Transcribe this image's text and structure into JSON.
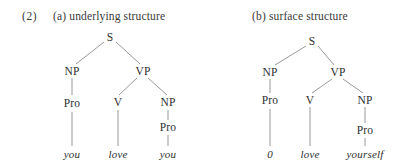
{
  "figure": {
    "example_number": "(2)",
    "caption_a": "(a) underlying structure",
    "caption_b": "(b) surface structure",
    "line_color": "#8d8d8d",
    "text_color": "#2f2f2f",
    "background_color": "#ffffff"
  },
  "tree_a": {
    "nodes": {
      "s": "S",
      "np_subject": "NP",
      "vp": "VP",
      "pro_subject": "Pro",
      "v": "V",
      "np_object": "NP",
      "pro_object": "Pro"
    },
    "terminals": {
      "subject": "you",
      "verb": "love",
      "object": "you"
    }
  },
  "tree_b": {
    "nodes": {
      "s": "S",
      "np_subject": "NP",
      "vp": "VP",
      "pro_subject": "Pro",
      "v": "V",
      "np_object": "NP",
      "pro_object": "Pro"
    },
    "terminals": {
      "subject": "0",
      "verb": "love",
      "object": "yourself"
    }
  }
}
